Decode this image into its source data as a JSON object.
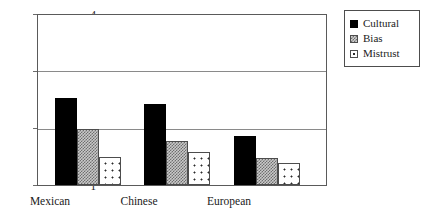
{
  "chart_data": {
    "type": "bar",
    "title": "",
    "subtitle": "",
    "xlabel": "",
    "ylabel": "",
    "categories": [
      "Mexican",
      "Chinese",
      "European"
    ],
    "series": [
      {
        "name": "Cultural",
        "values": [
          2.52,
          2.42,
          1.86
        ],
        "color": "#000000",
        "fill": "solid-black"
      },
      {
        "name": "Bias",
        "values": [
          1.99,
          1.78,
          1.47
        ],
        "color": "#9a9a9a",
        "fill": "checkered-gray"
      },
      {
        "name": "Mistrust",
        "values": [
          1.49,
          1.58,
          1.39
        ],
        "color": "#ffffff",
        "fill": "dotted-white"
      }
    ],
    "ylim": [
      1,
      4
    ],
    "yticks": [
      1,
      2,
      3,
      4
    ],
    "ytick_labels": [
      "1",
      "2",
      "3",
      "4"
    ],
    "grid": "horizontal",
    "gridlines_at": [
      2,
      3,
      4
    ],
    "legend_position": "right-outside",
    "legend_entries": [
      "Cultural",
      "Bias",
      "Mistrust"
    ],
    "frame": "box"
  },
  "axis": {
    "y_labels": [
      "4",
      "3",
      "2",
      "1"
    ],
    "x_labels": [
      "Mexican",
      "Chinese",
      "European"
    ]
  },
  "legend": {
    "items": [
      {
        "label": "Cultural"
      },
      {
        "label": "Bias"
      },
      {
        "label": "Mistrust"
      }
    ]
  }
}
